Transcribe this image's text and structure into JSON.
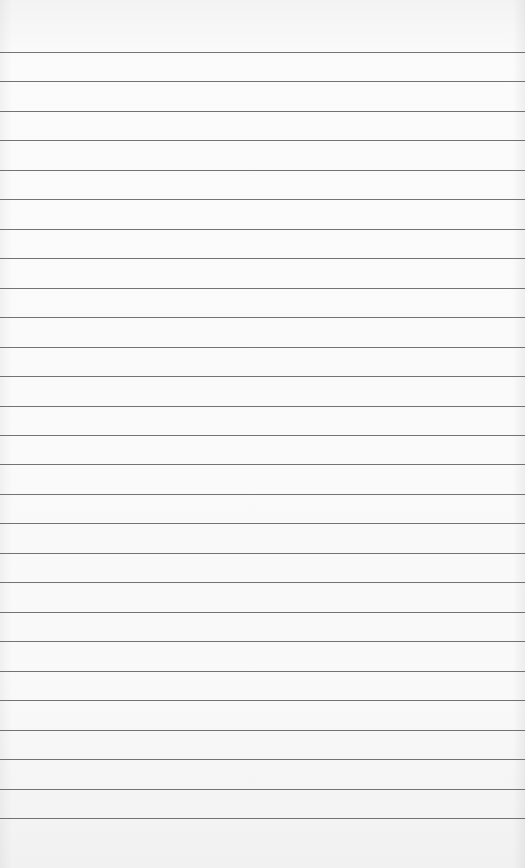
{
  "paper": {
    "type": "lined-notepad-page",
    "background_color": "#f8f8f8",
    "rule_color": "#5a5a5a",
    "first_rule_y": 52,
    "rule_spacing": 29.46,
    "rule_count": 27
  }
}
